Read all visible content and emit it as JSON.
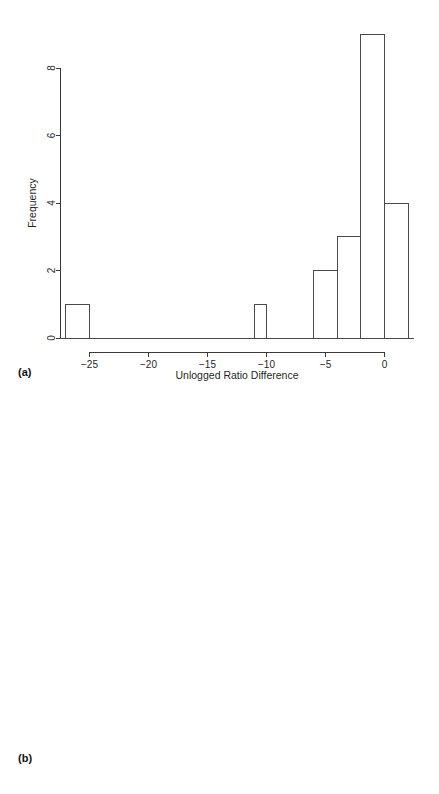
{
  "figure": {
    "panels": [
      {
        "id": "a",
        "label": "(a)",
        "ylabel": "Frequency",
        "xlabel": "Unlogged Ratio Difference"
      },
      {
        "id": "b",
        "label": "(b)",
        "ylabel": "Frequency",
        "xlabel": "Logged Ratio Difference"
      }
    ]
  },
  "chart_data": [
    {
      "type": "bar",
      "panel": "a",
      "title": "",
      "xlabel": "Unlogged Ratio Difference",
      "ylabel": "Frequency",
      "xlim": [
        -27.5,
        2.5
      ],
      "ylim": [
        0,
        9
      ],
      "xticks": [
        -25,
        -20,
        -15,
        -10,
        -5,
        0
      ],
      "xticklabels": [
        "−25",
        "−20",
        "−15",
        "−10",
        "−5",
        "0"
      ],
      "yticks": [
        0,
        2,
        4,
        6,
        8
      ],
      "yticklabels": [
        "0",
        "2",
        "4",
        "6",
        "8"
      ],
      "grid": false,
      "legend": "none",
      "bin_edges": [
        -27,
        -25,
        -11,
        -10,
        -6,
        -4,
        -2,
        0,
        2
      ],
      "bins": [
        {
          "x0": -27,
          "x1": -25,
          "value": 1
        },
        {
          "x0": -11,
          "x1": -10,
          "value": 1
        },
        {
          "x0": -6,
          "x1": -4,
          "value": 2
        },
        {
          "x0": -4,
          "x1": -2,
          "value": 3
        },
        {
          "x0": -2,
          "x1": 0,
          "value": 9
        },
        {
          "x0": 0,
          "x1": 2,
          "value": 4
        }
      ],
      "categories": [
        "-27 to -25",
        "-11 to -10",
        "-6 to -4",
        "-4 to -2",
        "-2 to 0",
        "0 to 2"
      ],
      "values": [
        1,
        1,
        2,
        3,
        9,
        4
      ]
    },
    {
      "type": "bar",
      "panel": "b",
      "title": "",
      "xlabel": "Logged Ratio Difference",
      "ylabel": "Frequency",
      "xlim": [
        -4,
        1
      ],
      "ylim": [
        0,
        9
      ],
      "xticks": [
        -4,
        -3,
        -2,
        -1,
        0,
        1
      ],
      "xticklabels": [
        "−4",
        "−3",
        "−2",
        "−1",
        "0",
        "1"
      ],
      "yticks": [
        0,
        2,
        4,
        6,
        8
      ],
      "yticklabels": [
        "0",
        "2",
        "4",
        "6",
        "8"
      ],
      "grid": false,
      "legend": "none",
      "bin_edges": [
        -4,
        -3,
        -2,
        -1,
        0,
        1
      ],
      "bins": [
        {
          "x0": -4,
          "x1": -3,
          "value": 1
        },
        {
          "x0": -3,
          "x1": -2,
          "value": 2
        },
        {
          "x0": -2,
          "x1": -1,
          "value": 4
        },
        {
          "x0": -1,
          "x1": 0,
          "value": 9
        },
        {
          "x0": 0,
          "x1": 1,
          "value": 4
        }
      ],
      "categories": [
        "-4 to -3",
        "-3 to -2",
        "-2 to -1",
        "-1 to 0",
        "0 to 1"
      ],
      "values": [
        1,
        2,
        4,
        9,
        4
      ]
    }
  ],
  "colors": {
    "background": "#ffffff",
    "ink": "#1f1f1f",
    "bar_stroke": "#4a4a4a",
    "axis": "#3a3a3a"
  }
}
